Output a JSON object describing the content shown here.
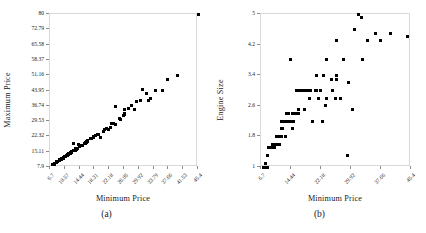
{
  "figure": {
    "panels": [
      {
        "caption": "(a)",
        "xlabel": "Minimum Price",
        "ylabel": "Maximum Price",
        "xticks": [
          "6.7",
          "10.57",
          "14.44",
          "18.31",
          "22.18",
          "26.05",
          "29.92",
          "33.79",
          "37.66",
          "41.53",
          "45.4"
        ],
        "yticks": [
          "80",
          "72.79",
          "65.58",
          "58.37",
          "51.16",
          "43.95",
          "36.74",
          "29.53",
          "22.32",
          "15.11",
          "7.9"
        ]
      },
      {
        "caption": "(b)",
        "xlabel": "Minimum Price",
        "ylabel": "Engine Size",
        "xticks": [
          "6.7",
          "14.44",
          "22.18",
          "29.92",
          "37.66",
          "45.4"
        ],
        "yticks": [
          "5",
          "4.2",
          "3.4",
          "2.6",
          "1.8",
          "1"
        ]
      }
    ]
  },
  "colors": {
    "marker": "#000000",
    "frame": "#d9d9d9",
    "text": "#1a1a1a",
    "background": "#ffffff"
  },
  "chart_data": [
    {
      "type": "scatter",
      "title": "",
      "caption": "(a)",
      "xlabel": "Minimum Price",
      "ylabel": "Maximum Price",
      "xlim": [
        6.7,
        45.4
      ],
      "ylim": [
        7.9,
        80
      ],
      "grid": false,
      "legend": null,
      "xticks": [
        6.7,
        10.57,
        14.44,
        18.31,
        22.18,
        26.05,
        29.92,
        33.79,
        37.66,
        41.53,
        45.4
      ],
      "yticks": [
        7.9,
        15.11,
        22.32,
        29.53,
        36.74,
        43.95,
        51.16,
        58.37,
        65.58,
        72.79,
        80
      ],
      "x": [
        12.9,
        29.2,
        25.9,
        30.8,
        23.7,
        14.2,
        19.9,
        22.6,
        26.3,
        33.0,
        37.5,
        8.5,
        11.4,
        13.4,
        15.1,
        15.9,
        16.6,
        13.7,
        11.6,
        14.0,
        15.9,
        20.8,
        23.7,
        26.3,
        31.9,
        14.8,
        16.3,
        19.5,
        22.0,
        8.4,
        12.1,
        11.6,
        13.3,
        9.1,
        10.9,
        12.4,
        10.1,
        11.3,
        8.4,
        8.0,
        9.1,
        10.6,
        9.6,
        12.2,
        16.3,
        18.5,
        20.9,
        28.0,
        34.3,
        7.9,
        9.2,
        11.1,
        9.1,
        10.7,
        12.0,
        14.9,
        17.3,
        18.2,
        24.8,
        27.2,
        30.4,
        9.8,
        11.5,
        13.7,
        16.1,
        18.0,
        19.1,
        22.9,
        26.1,
        8.4,
        9.5,
        12.3,
        14.4,
        16.5,
        19.3,
        21.5,
        25.1,
        28.9,
        32.5,
        36.2,
        40.1,
        45.4,
        7.4,
        8.6,
        10.1,
        11.9,
        13.5,
        15.6,
        17.6,
        21.0,
        23.3,
        11.1,
        12.8
      ],
      "y": [
        18.8,
        38.7,
        32.3,
        44.6,
        36.2,
        18.4,
        22.0,
        26.6,
        32.9,
        40.1,
        49.0,
        10.3,
        13.5,
        16.6,
        18.1,
        19.0,
        20.3,
        16.1,
        14.2,
        16.8,
        19.5,
        24.4,
        27.9,
        34.8,
        42.7,
        17.9,
        19.6,
        23.0,
        25.8,
        10.4,
        14.8,
        13.9,
        15.9,
        11.3,
        13.2,
        15.2,
        12.1,
        13.7,
        10.2,
        9.7,
        11.0,
        12.9,
        11.6,
        14.9,
        20.1,
        22.7,
        25.5,
        36.9,
        43.8,
        9.1,
        11.1,
        13.5,
        11.0,
        12.9,
        14.4,
        18.1,
        21.1,
        22.2,
        30.9,
        35.7,
        39.1,
        11.9,
        13.9,
        16.6,
        19.5,
        21.8,
        23.2,
        28.5,
        32.5,
        10.1,
        11.5,
        14.9,
        17.5,
        20.0,
        23.4,
        26.1,
        30.4,
        35.0,
        39.2,
        43.8,
        51.0,
        80.0,
        9.0,
        10.4,
        12.2,
        14.4,
        16.3,
        18.9,
        21.3,
        25.4,
        28.2,
        13.4,
        15.5
      ]
    },
    {
      "type": "scatter",
      "title": "",
      "caption": "(b)",
      "xlabel": "Minimum Price",
      "ylabel": "Engine Size",
      "xlim": [
        6.7,
        45.4
      ],
      "ylim": [
        1.0,
        5.0
      ],
      "grid": false,
      "legend": null,
      "xticks": [
        6.7,
        14.44,
        22.18,
        29.92,
        37.66,
        45.4
      ],
      "yticks": [
        1.0,
        1.8,
        2.6,
        3.4,
        4.2,
        5.0
      ],
      "x": [
        12.9,
        29.2,
        25.9,
        30.8,
        23.7,
        14.2,
        19.9,
        22.6,
        26.3,
        33.0,
        37.5,
        8.5,
        11.4,
        13.4,
        15.1,
        15.9,
        16.6,
        13.7,
        11.6,
        14.0,
        15.9,
        20.8,
        23.7,
        26.3,
        31.9,
        14.8,
        16.3,
        19.5,
        22.0,
        8.4,
        12.1,
        11.6,
        13.3,
        9.1,
        10.9,
        12.4,
        10.1,
        11.3,
        8.4,
        8.0,
        9.1,
        10.6,
        9.6,
        12.2,
        16.3,
        18.5,
        20.9,
        28.0,
        34.3,
        7.9,
        9.2,
        11.1,
        9.1,
        10.7,
        12.0,
        14.9,
        17.3,
        18.2,
        24.8,
        27.2,
        30.4,
        9.8,
        11.5,
        13.7,
        16.1,
        18.0,
        19.1,
        22.9,
        26.1,
        8.4,
        9.5,
        12.3,
        14.4,
        16.5,
        19.3,
        21.5,
        25.1,
        28.9,
        32.5,
        36.2,
        40.1,
        44.6,
        7.4,
        8.6,
        10.1,
        11.9,
        13.5,
        15.6,
        17.6,
        21.0,
        23.3,
        11.1,
        12.8
      ],
      "y": [
        1.8,
        3.2,
        2.8,
        4.6,
        2.8,
        3.8,
        2.2,
        2.2,
        3.4,
        3.8,
        4.3,
        1.0,
        1.6,
        2.2,
        2.2,
        3.0,
        3.0,
        2.2,
        1.8,
        2.2,
        3.0,
        3.0,
        3.8,
        4.3,
        5.0,
        2.0,
        2.5,
        3.0,
        3.0,
        1.3,
        2.2,
        1.8,
        2.4,
        1.5,
        1.6,
        2.2,
        1.5,
        1.6,
        1.3,
        1.0,
        1.5,
        1.8,
        1.6,
        2.0,
        2.4,
        3.0,
        3.0,
        3.8,
        4.3,
        1.1,
        1.5,
        1.8,
        1.5,
        1.6,
        2.0,
        2.4,
        3.0,
        3.0,
        3.3,
        2.8,
        2.5,
        1.6,
        1.8,
        2.4,
        2.4,
        2.5,
        2.8,
        3.4,
        3.3,
        1.3,
        1.5,
        2.2,
        2.2,
        2.4,
        3.0,
        2.8,
        3.0,
        1.3,
        4.9,
        4.5,
        4.5,
        4.4,
        1.0,
        1.5,
        1.6,
        1.8,
        2.2,
        2.4,
        3.0,
        3.4,
        2.6,
        1.6,
        2.2
      ]
    }
  ]
}
